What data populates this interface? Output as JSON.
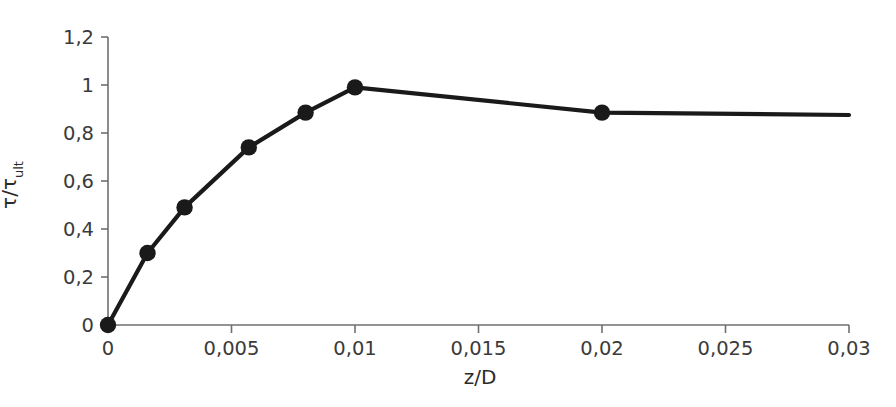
{
  "chart_data": {
    "type": "line",
    "title": "",
    "xlabel": "z/D",
    "ylabel": "τ/τult",
    "ylabel_base": "τ/τ",
    "ylabel_sub": "ult",
    "xlim": [
      0,
      0.03
    ],
    "ylim": [
      0,
      1.2
    ],
    "grid": false,
    "legend": "none",
    "decimal_separator": ",",
    "marker": "filled-circle",
    "line_color": "#1a1a1a",
    "marker_color": "#1a1a1a",
    "axis_color": "#6f6f6f",
    "xticks": [
      0,
      0.005,
      0.01,
      0.015,
      0.02,
      0.025,
      0.03
    ],
    "xtick_labels": [
      "0",
      "0,005",
      "0,01",
      "0,015",
      "0,02",
      "0,025",
      "0,03"
    ],
    "yticks": [
      0,
      0.2,
      0.4,
      0.6,
      0.8,
      1,
      1.2
    ],
    "ytick_labels": [
      "0",
      "0,2",
      "0,4",
      "0,6",
      "0,8",
      "1",
      "1,2"
    ],
    "series": [
      {
        "name": "t-z curve",
        "x": [
          0,
          0.0016,
          0.0031,
          0.0057,
          0.008,
          0.01,
          0.02,
          0.03
        ],
        "y": [
          0,
          0.3,
          0.49,
          0.74,
          0.885,
          0.99,
          0.885,
          0.875
        ],
        "markers_shown": [
          true,
          true,
          true,
          true,
          true,
          true,
          true,
          false
        ]
      }
    ]
  }
}
